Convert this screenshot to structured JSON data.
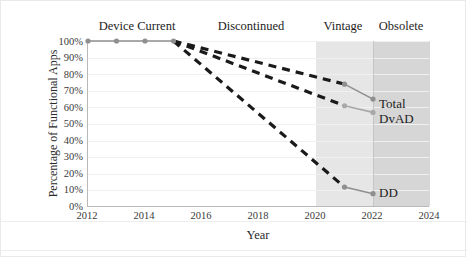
{
  "chart_data": {
    "type": "line",
    "title": "",
    "xlabel": "Year",
    "ylabel": "Percentage of Functional Apps",
    "xlim": [
      2012,
      2024
    ],
    "ylim": [
      0,
      100
    ],
    "grid": true,
    "legend_position": "right-endpoint-labels",
    "x_ticks": [
      "2012",
      "2014",
      "2016",
      "2018",
      "2020",
      "2022",
      "2024"
    ],
    "y_ticks": [
      "0%",
      "10%",
      "20%",
      "30%",
      "40%",
      "50%",
      "60%",
      "70%",
      "80%",
      "90%",
      "100%"
    ],
    "series": [
      {
        "name": "Total",
        "color": "#8f8f8f",
        "solid_points": [
          {
            "x": 2012,
            "y": 100
          },
          {
            "x": 2013,
            "y": 100
          },
          {
            "x": 2014,
            "y": 100
          },
          {
            "x": 2015,
            "y": 100
          }
        ],
        "dashed_points": [
          {
            "x": 2015,
            "y": 100
          },
          {
            "x": 2021,
            "y": 74
          }
        ],
        "tail_points": [
          {
            "x": 2021,
            "y": 74
          },
          {
            "x": 2022,
            "y": 65
          }
        ],
        "end_label": "Total",
        "end_value": 65
      },
      {
        "name": "DvAD",
        "color": "#a8a8a8",
        "solid_points": [
          {
            "x": 2012,
            "y": 100
          },
          {
            "x": 2015,
            "y": 100
          }
        ],
        "dashed_points": [
          {
            "x": 2015,
            "y": 100
          },
          {
            "x": 2021,
            "y": 61
          }
        ],
        "tail_points": [
          {
            "x": 2021,
            "y": 61
          },
          {
            "x": 2022,
            "y": 57
          }
        ],
        "end_label": "DvAD",
        "end_value": 57
      },
      {
        "name": "DD",
        "color": "#8f8f8f",
        "solid_points": [
          {
            "x": 2012,
            "y": 100
          },
          {
            "x": 2015,
            "y": 100
          }
        ],
        "dashed_points": [
          {
            "x": 2015,
            "y": 100
          },
          {
            "x": 2021,
            "y": 12
          }
        ],
        "tail_points": [
          {
            "x": 2021,
            "y": 12
          },
          {
            "x": 2022,
            "y": 8
          }
        ],
        "end_label": "DD",
        "end_value": 8
      }
    ],
    "phase_bands": [
      {
        "label": "Device Current",
        "from": 2012,
        "to": 2016,
        "shade": "none"
      },
      {
        "label": "Discontinued",
        "from": 2016,
        "to": 2020,
        "shade": "none"
      },
      {
        "label": "Vintage",
        "from": 2020,
        "to": 2022,
        "shade": "#e2e2e2"
      },
      {
        "label": "Obsolete",
        "from": 2022,
        "to": 2024,
        "shade": "#d2d2d2"
      }
    ],
    "annotations": []
  },
  "axes": {
    "y_title": "Percentage of Functional Apps",
    "x_title": "Year",
    "y_ticks": [
      "100%",
      "90%",
      "80%",
      "70%",
      "60%",
      "50%",
      "40%",
      "30%",
      "20%",
      "10%",
      "0%"
    ],
    "x_ticks": [
      "2012",
      "2014",
      "2016",
      "2018",
      "2020",
      "2022",
      "2024"
    ]
  },
  "phases": [
    {
      "label": "Device Current"
    },
    {
      "label": "Discontinued"
    },
    {
      "label": "Vintage"
    },
    {
      "label": "Obsolete"
    }
  ],
  "series_labels": [
    {
      "label": "Total"
    },
    {
      "label": "DvAD"
    },
    {
      "label": "DD"
    }
  ]
}
